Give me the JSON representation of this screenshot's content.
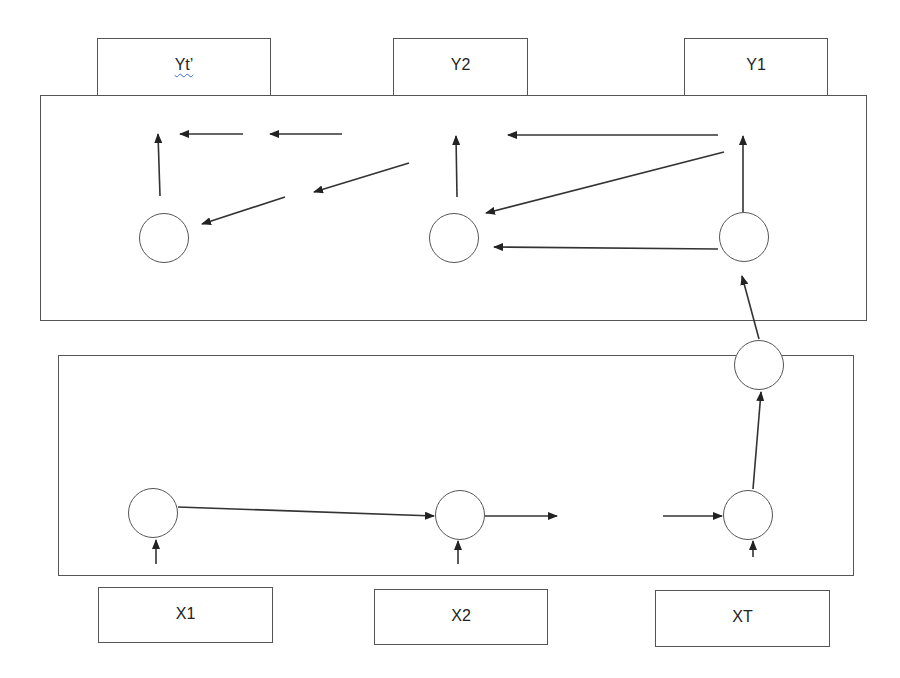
{
  "diagram": {
    "type": "encoder-decoder sequence model",
    "colors": {
      "stroke": "#555555",
      "arrow": "#222222",
      "background": "#ffffff",
      "spellcheck_underline": "#3a6bc8"
    },
    "outputs": [
      {
        "id": "yt",
        "label": "Yt’"
      },
      {
        "id": "y2",
        "label": "Y2"
      },
      {
        "id": "y1",
        "label": "Y1"
      }
    ],
    "inputs": [
      {
        "id": "x1",
        "label": "X1"
      },
      {
        "id": "x2",
        "label": "X2"
      },
      {
        "id": "xt",
        "label": "XT"
      }
    ],
    "panels": [
      {
        "id": "decoder",
        "role": "decoder panel (top)"
      },
      {
        "id": "encoder",
        "role": "encoder panel (bottom)"
      }
    ],
    "nodes": {
      "decoder": [
        "decoder-node-t",
        "decoder-node-2",
        "decoder-node-1"
      ],
      "context": "context-node",
      "encoder": [
        "encoder-node-1",
        "encoder-node-2",
        "encoder-node-t"
      ]
    }
  }
}
